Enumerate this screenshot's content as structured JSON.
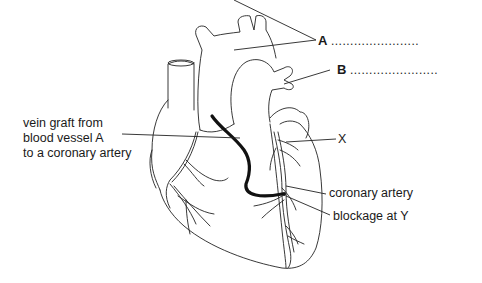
{
  "diagram": {
    "labels": {
      "A": {
        "letter": "A",
        "answer_blank": "......................."
      },
      "B": {
        "letter": "B",
        "answer_blank": "......................."
      },
      "vein_graft": [
        "vein graft from",
        "blood vessel A",
        "to a coronary artery"
      ],
      "X": "X",
      "coronary_artery": "coronary artery",
      "blockage": "blockage at Y"
    },
    "colors": {
      "line": "#222222",
      "graft": "#111111",
      "background": "#ffffff"
    }
  }
}
